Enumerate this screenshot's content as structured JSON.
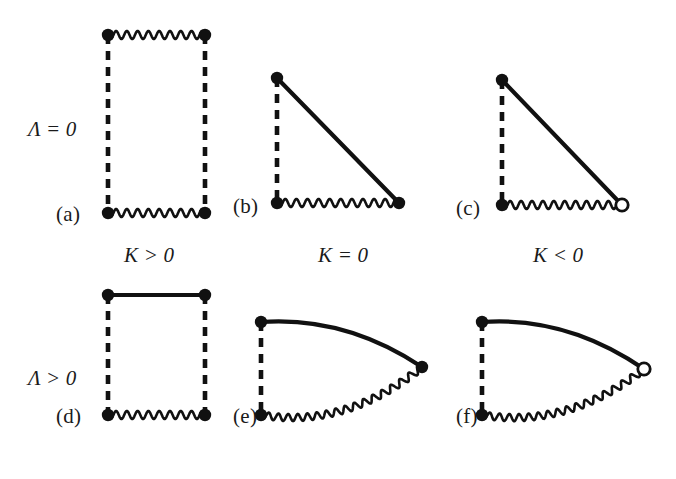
{
  "figure": {
    "caption_row_labels": [
      "Λ = 0",
      "Λ > 0"
    ],
    "caption_col_labels": [
      "K > 0",
      "K = 0",
      "K < 0"
    ],
    "background_color": "#ffffff",
    "ink_color": "#111111"
  },
  "row_labels": [
    {
      "symbol": "Λ",
      "op": "=",
      "value": "0",
      "text": "Λ = 0",
      "x": 28,
      "y": 117
    },
    {
      "symbol": "Λ",
      "op": ">",
      "value": "0",
      "text": "Λ > 0",
      "x": 28,
      "y": 366
    }
  ],
  "col_labels": [
    {
      "symbol": "K",
      "op": ">",
      "value": "0",
      "text": "K > 0",
      "x": 124,
      "y": 243
    },
    {
      "symbol": "K",
      "op": "=",
      "value": "0",
      "text": "K = 0",
      "x": 318,
      "y": 243
    },
    {
      "symbol": "K",
      "op": "<",
      "value": "0",
      "text": "K < 0",
      "x": 533,
      "y": 243
    }
  ],
  "panels": [
    {
      "id": "a",
      "letter": "(a)",
      "letter_x": 56,
      "letter_y": 202,
      "lambda": "Λ = 0",
      "K": "K > 0",
      "shape": "rectangle",
      "top_edge": "wavy",
      "bottom_edge": "wavy",
      "left_edge": "dashed",
      "right_edge": "dashed",
      "vertices": [
        {
          "name": "top-left",
          "x": 108,
          "y": 35,
          "marker": "filled-dot"
        },
        {
          "name": "top-right",
          "x": 205,
          "y": 35,
          "marker": "filled-dot"
        },
        {
          "name": "bottom-right",
          "x": 205,
          "y": 213,
          "marker": "filled-dot"
        },
        {
          "name": "bottom-left",
          "x": 108,
          "y": 213,
          "marker": "filled-dot"
        }
      ]
    },
    {
      "id": "b",
      "letter": "(b)",
      "letter_x": 233,
      "letter_y": 194,
      "lambda": "Λ = 0",
      "K": "K = 0",
      "shape": "right-triangle",
      "top_edge": "none",
      "bottom_edge": "wavy",
      "left_edge": "dashed",
      "hypotenuse": "solid",
      "vertices": [
        {
          "name": "apex",
          "x": 277,
          "y": 78,
          "marker": "filled-dot"
        },
        {
          "name": "bottom-left",
          "x": 277,
          "y": 203,
          "marker": "filled-dot"
        },
        {
          "name": "bottom-right",
          "x": 399,
          "y": 203,
          "marker": "filled-dot"
        }
      ]
    },
    {
      "id": "c",
      "letter": "(c)",
      "letter_x": 456,
      "letter_y": 196,
      "lambda": "Λ = 0",
      "K": "K < 0",
      "shape": "right-triangle",
      "top_edge": "none",
      "bottom_edge": "wavy",
      "left_edge": "dashed",
      "hypotenuse": "solid",
      "vertices": [
        {
          "name": "apex",
          "x": 502,
          "y": 80,
          "marker": "filled-dot"
        },
        {
          "name": "bottom-left",
          "x": 502,
          "y": 205,
          "marker": "filled-dot"
        },
        {
          "name": "bottom-right",
          "x": 622,
          "y": 205,
          "marker": "open-circle"
        }
      ]
    },
    {
      "id": "d",
      "letter": "(d)",
      "letter_x": 56,
      "letter_y": 404,
      "lambda": "Λ > 0",
      "K": "K > 0",
      "shape": "rectangle",
      "top_edge": "solid",
      "bottom_edge": "wavy",
      "left_edge": "dashed",
      "right_edge": "dashed",
      "vertices": [
        {
          "name": "top-left",
          "x": 108,
          "y": 295,
          "marker": "filled-dot"
        },
        {
          "name": "top-right",
          "x": 205,
          "y": 295,
          "marker": "filled-dot"
        },
        {
          "name": "bottom-right",
          "x": 205,
          "y": 415,
          "marker": "filled-dot"
        },
        {
          "name": "bottom-left",
          "x": 108,
          "y": 415,
          "marker": "filled-dot"
        }
      ]
    },
    {
      "id": "e",
      "letter": "(e)",
      "letter_x": 233,
      "letter_y": 404,
      "lambda": "Λ > 0",
      "K": "K = 0",
      "shape": "lens",
      "top_edge": "solid-curved",
      "bottom_edge": "wavy-curved",
      "left_edge": "dashed",
      "vertices": [
        {
          "name": "top-left",
          "x": 261,
          "y": 322,
          "marker": "filled-dot"
        },
        {
          "name": "bottom-left",
          "x": 261,
          "y": 415,
          "marker": "filled-dot"
        },
        {
          "name": "right-tip",
          "x": 422,
          "y": 367,
          "marker": "filled-dot"
        }
      ]
    },
    {
      "id": "f",
      "letter": "(f)",
      "letter_x": 456,
      "letter_y": 404,
      "lambda": "Λ > 0",
      "K": "K < 0",
      "shape": "lens",
      "top_edge": "solid-curved",
      "bottom_edge": "wavy-curved",
      "left_edge": "dashed",
      "vertices": [
        {
          "name": "top-left",
          "x": 482,
          "y": 322,
          "marker": "filled-dot"
        },
        {
          "name": "bottom-left",
          "x": 482,
          "y": 415,
          "marker": "filled-dot"
        },
        {
          "name": "right-tip",
          "x": 644,
          "y": 369,
          "marker": "open-circle"
        }
      ]
    }
  ],
  "style": {
    "stroke_solid": 4.2,
    "stroke_wavy": 2.6,
    "dash_pattern": "9 7",
    "dash_width": 4.6,
    "dot_radius": 6.2,
    "open_radius": 6.2,
    "open_stroke": 2.8,
    "wave_amplitude": 4.0,
    "wave_period": 11.0
  }
}
